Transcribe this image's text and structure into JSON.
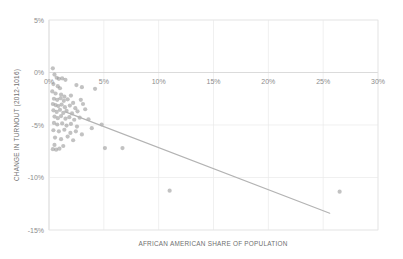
{
  "chart_data": {
    "type": "scatter",
    "title": "",
    "xlabel": "AFRICAN AMERICAN SHARE OF POPULATION",
    "ylabel": "CHANGE IN TURNOUT (2012-1016)",
    "xlim": [
      0,
      30
    ],
    "ylim": [
      -15,
      5
    ],
    "xticks": [
      0,
      5,
      10,
      15,
      20,
      25,
      30
    ],
    "yticks": [
      5,
      0,
      -5,
      -10,
      -15
    ],
    "xticklabels": [
      "0%",
      "5%",
      "10%",
      "15%",
      "20%",
      "25%",
      "30%"
    ],
    "yticklabels": [
      "5%",
      "0%",
      "-5%",
      "-10%",
      "-15%"
    ],
    "grid": true,
    "legend": null,
    "series": [
      {
        "name": "counties",
        "marker": "circle",
        "color": "#8f8f8f",
        "points": [
          [
            0.35,
            0.4
          ],
          [
            0.5,
            -0.2
          ],
          [
            0.7,
            -0.5
          ],
          [
            0.9,
            -0.6
          ],
          [
            1.2,
            -0.55
          ],
          [
            1.5,
            -0.7
          ],
          [
            0.4,
            -1.1
          ],
          [
            0.8,
            -1.3
          ],
          [
            1.0,
            -1.5
          ],
          [
            2.5,
            -1.2
          ],
          [
            3.0,
            -1.4
          ],
          [
            0.3,
            -1.8
          ],
          [
            0.6,
            -2.0
          ],
          [
            1.1,
            -2.1
          ],
          [
            1.4,
            -2.3
          ],
          [
            2.0,
            -2.2
          ],
          [
            4.2,
            -1.55
          ],
          [
            0.45,
            -2.5
          ],
          [
            0.75,
            -2.6
          ],
          [
            1.05,
            -2.45
          ],
          [
            1.35,
            -2.7
          ],
          [
            1.7,
            -2.55
          ],
          [
            2.2,
            -2.9
          ],
          [
            2.9,
            -2.6
          ],
          [
            0.35,
            -3.0
          ],
          [
            0.6,
            -3.1
          ],
          [
            0.85,
            -3.2
          ],
          [
            1.15,
            -3.05
          ],
          [
            1.45,
            -3.3
          ],
          [
            1.9,
            -3.15
          ],
          [
            2.4,
            -3.4
          ],
          [
            3.1,
            -3.0
          ],
          [
            0.4,
            -3.6
          ],
          [
            0.7,
            -3.75
          ],
          [
            1.0,
            -3.55
          ],
          [
            1.3,
            -3.85
          ],
          [
            1.6,
            -3.65
          ],
          [
            2.1,
            -3.9
          ],
          [
            2.6,
            -3.7
          ],
          [
            3.3,
            -3.5
          ],
          [
            0.5,
            -4.2
          ],
          [
            0.8,
            -4.35
          ],
          [
            1.1,
            -4.15
          ],
          [
            1.5,
            -4.4
          ],
          [
            1.85,
            -4.25
          ],
          [
            2.3,
            -4.5
          ],
          [
            2.8,
            -4.3
          ],
          [
            3.6,
            -4.45
          ],
          [
            0.45,
            -4.8
          ],
          [
            0.75,
            -4.95
          ],
          [
            1.2,
            -4.85
          ],
          [
            1.6,
            -5.05
          ],
          [
            2.0,
            -4.9
          ],
          [
            2.55,
            -5.15
          ],
          [
            3.9,
            -5.3
          ],
          [
            4.8,
            -4.95
          ],
          [
            0.4,
            -5.5
          ],
          [
            0.9,
            -5.6
          ],
          [
            1.4,
            -5.45
          ],
          [
            1.95,
            -5.75
          ],
          [
            2.45,
            -5.6
          ],
          [
            3.0,
            -5.9
          ],
          [
            0.55,
            -6.2
          ],
          [
            1.1,
            -6.35
          ],
          [
            1.7,
            -6.1
          ],
          [
            2.2,
            -6.45
          ],
          [
            0.5,
            -6.9
          ],
          [
            1.3,
            -7.0
          ],
          [
            0.35,
            -7.3
          ],
          [
            0.65,
            -7.35
          ],
          [
            0.95,
            -7.25
          ],
          [
            5.1,
            -7.2
          ],
          [
            6.7,
            -7.2
          ],
          [
            11.0,
            -11.25
          ],
          [
            26.5,
            -11.35
          ]
        ]
      }
    ],
    "trendline": {
      "x0": 1.5,
      "y0": -3.75,
      "x1": 25.6,
      "y1": -13.4,
      "color": "#b3b3b3"
    }
  }
}
